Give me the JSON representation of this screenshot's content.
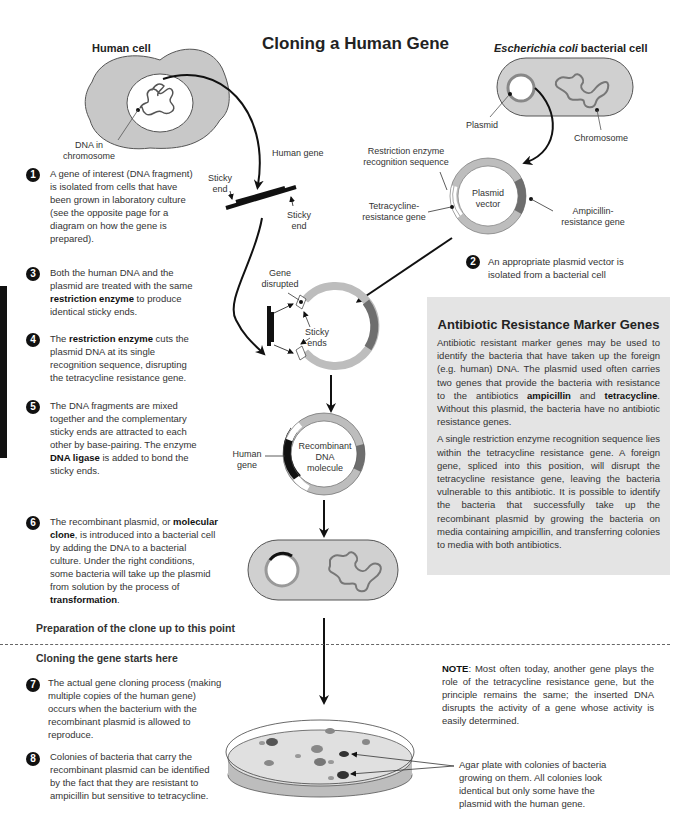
{
  "title": "Cloning a Human Gene",
  "human_cell": {
    "heading": "Human cell",
    "dna_label_line1": "DNA in",
    "dna_label_line2": "chromosome"
  },
  "ecoli": {
    "heading_italic": "Escherichia coli",
    "heading_rest": " bacterial cell",
    "plasmid_label": "Plasmid",
    "chromosome_label": "Chromosome"
  },
  "gene_fragment": {
    "human_gene_label": "Human gene",
    "sticky_end_left_1": "Sticky",
    "sticky_end_left_2": "end",
    "sticky_end_right_1": "Sticky",
    "sticky_end_right_2": "end"
  },
  "plasmid_vector": {
    "center_1": "Plasmid",
    "center_2": "vector",
    "restriction_1": "Restriction enzyme",
    "restriction_2": "recognition sequence",
    "tet_1": "Tetracycline-",
    "tet_2": "resistance gene",
    "amp_1": "Ampicillin-",
    "amp_2": "resistance gene"
  },
  "cut_plasmid": {
    "gene_disrupted_1": "Gene",
    "gene_disrupted_2": "disrupted",
    "sticky_ends_1": "Sticky",
    "sticky_ends_2": "ends"
  },
  "recombinant": {
    "center_1": "Recombinant",
    "center_2": "DNA",
    "center_3": "molecule",
    "human_gene_1": "Human",
    "human_gene_2": "gene"
  },
  "steps": [
    {
      "num": "1",
      "parts": [
        "A gene of interest (DNA fragment) is isolated from cells that have been grown in laboratory culture (see the opposite page for a diagram on how the gene is prepared)."
      ]
    },
    {
      "num": "2",
      "parts": [
        "An appropriate plasmid vector is isolated from a bacterial cell"
      ]
    },
    {
      "num": "3",
      "pre": "Both the human DNA and the plasmid are treated with the same ",
      "bold": "restriction enzyme",
      "post": " to produce identical sticky ends."
    },
    {
      "num": "4",
      "pre": "The ",
      "bold": "restriction enzyme",
      "post": " cuts the plasmid DNA at its single recognition sequence, disrupting the tetracycline resistance gene."
    },
    {
      "num": "5",
      "pre": "The DNA fragments are mixed together and the complementary sticky ends are attracted to each other by base-pairing. The enzyme ",
      "bold": "DNA ligase",
      "post": " is added to bond the sticky ends."
    },
    {
      "num": "6",
      "pre": "The recombinant plasmid, or ",
      "bold": "molecular clone",
      "mid": ", is introduced into a bacterial cell by adding the DNA to a bacterial culture. Under the right conditions, some bacteria will take up the plasmid from solution by the process of ",
      "bold2": "transformation",
      "post": "."
    },
    {
      "num": "7",
      "text": "The actual gene cloning process (making multiple copies of the human gene) occurs when the bacterium with the recombinant plasmid is allowed to reproduce."
    },
    {
      "num": "8",
      "text": "Colonies of bacteria that carry the recombinant plasmid can be identified by the fact that they are resistant to ampicillin but sensitive to tetracycline."
    }
  ],
  "marker_box": {
    "title": "Antibiotic Resistance Marker Genes",
    "p1_pre": "Antibiotic resistant marker genes may be used to identify the bacteria that have taken up the foreign (e.g. human) DNA. The plasmid used often carries two genes that provide the bacteria with resistance to the antibiotics ",
    "p1_bold1": "ampicillin",
    "p1_mid": " and ",
    "p1_bold2": "tetracycline",
    "p1_post": ". Without this plasmid, the bacteria have no antibiotic resistance genes.",
    "p2": "A single restriction enzyme recognition sequence lies within the tetracycline resistance gene. A foreign gene, spliced into this position, will disrupt the tetracycline resistance gene, leaving the bacteria vulnerable to this antibiotic. It is possible to identify the bacteria that successfully take up the recombinant plasmid by growing the bacteria on media containing ampicillin, and transferring colonies to media with both antibiotics."
  },
  "sections": {
    "prep": "Preparation of the clone up to this point",
    "cloning": "Cloning the gene starts here"
  },
  "note": {
    "bold": "NOTE",
    "text": ":  Most often today, another gene plays the role of the tetracycline resistance gene, but the principle remains the same; the inserted DNA disrupts the activity of a gene whose activity is easily determined."
  },
  "agar": {
    "caption": "Agar plate with colonies of bacteria growing on them. All colonies look identical but only some have the plasmid with the human gene."
  },
  "colors": {
    "cell_fill": "#c8c8c8",
    "plasmid_light": "#bdbdbd",
    "plasmid_dark": "#6e6e6e",
    "box_bg": "#e4e4e4",
    "ink": "#111111"
  }
}
